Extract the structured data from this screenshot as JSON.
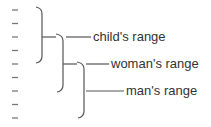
{
  "diagram": {
    "labels": [
      {
        "id": "child",
        "text": "child's range"
      },
      {
        "id": "woman",
        "text": "woman's range"
      },
      {
        "id": "man",
        "text": "man's range"
      }
    ],
    "tick_count": 9,
    "colors": {
      "line": "#555555",
      "tick": "#777777",
      "text": "#333333"
    }
  }
}
